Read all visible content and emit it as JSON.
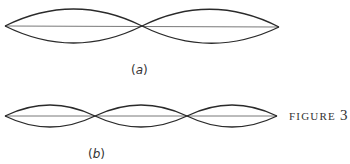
{
  "figure": {
    "caption_word": "FIGURE",
    "caption_number": "3",
    "panels": [
      {
        "id": "a",
        "label_open": "(",
        "label_letter": "a",
        "label_close": ")",
        "loops": 2,
        "description": "Standing wave, second harmonic: two loops with one interior node",
        "nodes_x": [
          5,
          142,
          279
        ],
        "axis_y": 26,
        "amplitude": 17
      },
      {
        "id": "b",
        "label_open": "(",
        "label_letter": "b",
        "label_close": ")",
        "loops": 3,
        "description": "Standing wave, third harmonic: three loops with two interior nodes",
        "nodes_x": [
          5,
          95,
          187,
          277
        ],
        "axis_y": 116,
        "amplitude": 11
      }
    ]
  },
  "colors": {
    "stroke": "#2a2a2a",
    "axis": "#555555",
    "background": "#ffffff"
  }
}
